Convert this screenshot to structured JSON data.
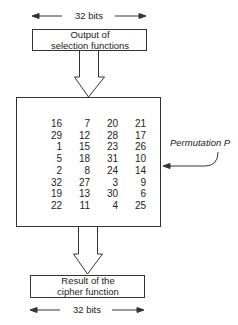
{
  "top": {
    "width_label": "32 bits",
    "box_line1": "Output of",
    "box_line2": "selection functions"
  },
  "permutation": {
    "label": "Permutation P",
    "table": [
      [
        16,
        7,
        20,
        21
      ],
      [
        29,
        12,
        28,
        17
      ],
      [
        1,
        15,
        23,
        26
      ],
      [
        5,
        18,
        31,
        10
      ],
      [
        2,
        8,
        24,
        14
      ],
      [
        32,
        27,
        3,
        9
      ],
      [
        19,
        13,
        30,
        6
      ],
      [
        22,
        11,
        4,
        25
      ]
    ]
  },
  "bottom": {
    "box_line1": "Result of the",
    "box_line2": "cipher function",
    "width_label": "32 bits"
  },
  "colors": {
    "line": "#333333",
    "text": "#222222",
    "background": "#ffffff"
  }
}
